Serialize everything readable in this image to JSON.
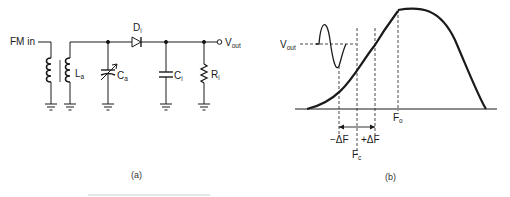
{
  "circuit": {
    "input_label": "FM in",
    "inductor_label": "L",
    "inductor_sub": "a",
    "capacitor_a_label": "C",
    "capacitor_a_sub": "a",
    "diode_label": "D",
    "diode_sub": "i",
    "capacitor_i_label": "C",
    "capacitor_i_sub": "i",
    "resistor_label": "R",
    "resistor_sub": "i",
    "output_label": "V",
    "output_sub": "out",
    "caption": "(a)"
  },
  "curve": {
    "vout_label": "V",
    "vout_sub": "out",
    "minus_df": "−ΔF",
    "plus_df": "+ΔF",
    "fc_label": "F",
    "fc_sub": "c",
    "fo_label": "F",
    "fo_sub": "o",
    "caption": "(b)"
  },
  "colors": {
    "ink": "#1a1a1a",
    "background": "#ffffff"
  }
}
